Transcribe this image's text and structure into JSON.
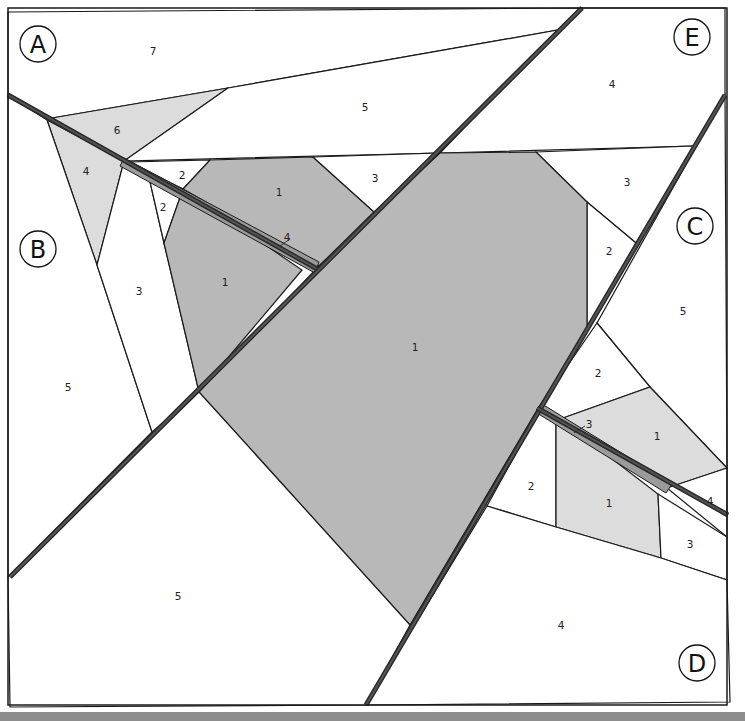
{
  "colors": {
    "white": "#ffffff",
    "light_gray": "#dcdcdc",
    "mid_gray": "#b8b8b8",
    "strip_gray": "#9a9a9a",
    "line": "#1a1a1a",
    "bar": "#8c8c8c"
  },
  "sections": [
    {
      "letter": "A",
      "cx": 38,
      "cy": 44,
      "r": 18
    },
    {
      "letter": "B",
      "cx": 38,
      "cy": 249,
      "r": 18
    },
    {
      "letter": "C",
      "cx": 695,
      "cy": 226,
      "r": 18
    },
    {
      "letter": "D",
      "cx": 697,
      "cy": 663,
      "r": 18
    },
    {
      "letter": "E",
      "cx": 692,
      "cy": 37,
      "r": 18
    }
  ],
  "pieces": [
    {
      "id": "A7",
      "section": "A",
      "number": "7",
      "fill": "#ffffff",
      "points": "8,12 582,8 558,30 228,88 52,118 8,95",
      "label": [
        153,
        51
      ]
    },
    {
      "id": "A6",
      "section": "A",
      "number": "6",
      "fill": "#dcdcdc",
      "points": "52,118 228,88 124,161",
      "label": [
        117,
        130
      ]
    },
    {
      "id": "A5",
      "section": "A",
      "number": "5",
      "fill": "#ffffff",
      "points": "228,88 558,30 440,153 124,161",
      "label": [
        365,
        107
      ]
    },
    {
      "id": "B4",
      "section": "B",
      "number": "4",
      "fill": "#dcdcdc",
      "points": "47,120 124,161 97,265",
      "label": [
        86,
        171
      ]
    },
    {
      "id": "B5",
      "section": "B",
      "number": "5",
      "fill": "#ffffff",
      "points": "8,95 47,120 97,265 152,432 8,577",
      "label": [
        68,
        387
      ]
    },
    {
      "id": "B3",
      "section": "B",
      "number": "3",
      "fill": "#ffffff",
      "points": "124,161 148,173 164,243 199,392 152,432 97,265",
      "label": [
        139,
        291
      ]
    },
    {
      "id": "B2a",
      "section": "B",
      "number": "2",
      "fill": "#ffffff",
      "points": "130,162 210,160 183,189",
      "label": [
        182,
        175
      ]
    },
    {
      "id": "B2b",
      "section": "B",
      "number": "2",
      "fill": "#ffffff",
      "points": "148,173 183,189 164,243",
      "label": [
        163,
        207
      ]
    },
    {
      "id": "B1",
      "section": "B",
      "number": "1",
      "fill": "#b8b8b8",
      "points": "183,189 302,270 199,392 164,243",
      "label": [
        225,
        282
      ]
    },
    {
      "id": "A1",
      "section": "A",
      "number": "1",
      "fill": "#b8b8b8",
      "points": "210,160 313,157 374,212 319,266 183,189",
      "label": [
        279,
        192
      ]
    },
    {
      "id": "A3",
      "section": "A",
      "number": "3",
      "fill": "#ffffff",
      "points": "313,157 440,153 374,212",
      "label": [
        375,
        178
      ]
    },
    {
      "id": "E4",
      "section": "E",
      "number": "4",
      "fill": "#ffffff",
      "points": "582,8 725,8 725,95 694,146 440,153 558,30",
      "label": [
        612,
        84
      ]
    },
    {
      "id": "E3",
      "section": "E",
      "number": "3",
      "fill": "#ffffff",
      "points": "536,152 694,146 636,243 587,202",
      "label": [
        627,
        182
      ]
    },
    {
      "id": "E2",
      "section": "E",
      "number": "2",
      "fill": "#ffffff",
      "points": "587,202 636,243 587,330",
      "label": [
        609,
        251
      ]
    },
    {
      "id": "E1",
      "section": "E",
      "number": "1",
      "fill": "#b8b8b8",
      "points": "440,153 536,152 587,202 587,330 537,410 410,625 199,392 319,266",
      "label": [
        415,
        347
      ]
    },
    {
      "id": "C5",
      "section": "C",
      "number": "5",
      "fill": "#ffffff",
      "points": "725,95 727,468 650,387 597,323",
      "label": [
        683,
        311
      ]
    },
    {
      "id": "C2",
      "section": "C",
      "number": "2",
      "fill": "#ffffff",
      "points": "597,323 650,387 563,418 537,410",
      "label": [
        598,
        373
      ]
    },
    {
      "id": "C1",
      "section": "C",
      "number": "1",
      "fill": "#dcdcdc",
      "points": "563,418 650,387 727,468 667,488",
      "label": [
        657,
        436
      ]
    },
    {
      "id": "C4",
      "section": "C",
      "number": "4",
      "fill": "#ffffff",
      "points": "667,488 727,468 727,537",
      "label": [
        710,
        501
      ]
    },
    {
      "id": "D2",
      "section": "D",
      "number": "2",
      "fill": "#ffffff",
      "points": "540,410 556,416 556,527 487,506",
      "label": [
        531,
        486
      ]
    },
    {
      "id": "D1",
      "section": "D",
      "number": "1",
      "fill": "#dcdcdc",
      "points": "556,416 658,494 661,558 556,527",
      "label": [
        609,
        503
      ]
    },
    {
      "id": "D3",
      "section": "D",
      "number": "3",
      "fill": "#ffffff",
      "points": "658,494 727,537 727,580 661,558",
      "label": [
        690,
        544
      ]
    },
    {
      "id": "D4",
      "section": "D",
      "number": "4",
      "fill": "#ffffff",
      "points": "487,506 556,527 661,558 727,580 730,702 366,705",
      "label": [
        561,
        625
      ]
    },
    {
      "id": "B5b",
      "section": "B",
      "number": "5",
      "fill": "#ffffff",
      "points": "8,577 199,392 410,625 366,705 10,707",
      "label": [
        178,
        596
      ]
    }
  ],
  "strips": [
    {
      "id": "A4-strip",
      "number": "4",
      "fill": "#9a9a9a",
      "points": "124,158 319,262 315,273 120,166",
      "label": [
        287,
        237
      ],
      "leader": "280,246 290,239"
    },
    {
      "id": "C3-strip",
      "number": "3",
      "fill": "#9a9a9a",
      "points": "542,404 672,484 666,493 537,413",
      "label": [
        589,
        424
      ],
      "leader": "574,433 585,426"
    }
  ],
  "seams": [
    {
      "id": "seam-A-B",
      "x1": 8,
      "y1": 95,
      "x2": 319,
      "y2": 270
    },
    {
      "id": "seam-diag-1",
      "x1": 582,
      "y1": 8,
      "x2": 10,
      "y2": 577
    },
    {
      "id": "seam-diag-2",
      "x1": 725,
      "y1": 95,
      "x2": 366,
      "y2": 705
    },
    {
      "id": "seam-C-D",
      "x1": 537,
      "y1": 408,
      "x2": 728,
      "y2": 515
    }
  ],
  "frame": {
    "x": 8,
    "y": 8,
    "width": 719,
    "height": 697
  }
}
